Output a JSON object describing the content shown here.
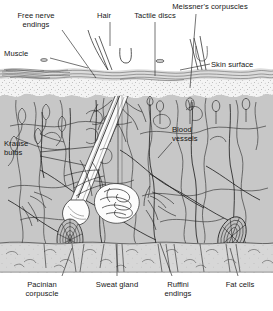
{
  "diagram": {
    "type": "anatomical-cross-section",
    "background_color": "#ffffff",
    "ink_color": "#1a1a1a"
  },
  "layers": [
    {
      "id": "air",
      "name": "Air above skin",
      "color": "#ffffff",
      "y_top": 0,
      "y_bottom": 68
    },
    {
      "id": "stratum",
      "name": "Skin surface / stratum corneum",
      "color": "#d9d9d9",
      "y_top": 68,
      "y_bottom": 82
    },
    {
      "id": "epidermis",
      "name": "Epidermis (stippled)",
      "color": "#f2f2f2",
      "y_top": 82,
      "y_bottom": 100
    },
    {
      "id": "dermis",
      "name": "Dermis",
      "color": "#c6c6c6",
      "y_top": 100,
      "y_bottom": 243
    },
    {
      "id": "subcutis",
      "name": "Subcutaneous fat",
      "color": "#d6d6d6",
      "y_top": 243,
      "y_bottom": 272
    }
  ],
  "labels": [
    {
      "id": "free-nerve-endings",
      "text": "Free nerve\nendings",
      "x": 36,
      "y": 12,
      "align": "center",
      "leader_to": {
        "x": 92,
        "y": 76
      }
    },
    {
      "id": "hair",
      "text": "Hair",
      "x": 103,
      "y": 12,
      "align": "center",
      "leader_to": {
        "x": 110,
        "y": 70
      }
    },
    {
      "id": "tactile-discs",
      "text": "Tactile discs",
      "x": 138,
      "y": 12,
      "align": "center",
      "leader_to": {
        "x": 152,
        "y": 92
      }
    },
    {
      "id": "meissners-corpuscles",
      "text": "Meissner's corpuscles",
      "x": 196,
      "y": 3,
      "align": "center",
      "leader_to": {
        "x": 192,
        "y": 96
      }
    },
    {
      "id": "muscle",
      "text": "Muscle",
      "x": 4,
      "y": 50,
      "align": "left",
      "leader_to": {
        "x": 86,
        "y": 70
      }
    },
    {
      "id": "skin-surface",
      "text": "Skin surface",
      "x": 212,
      "y": 61,
      "align": "left",
      "leader_to": {
        "x": 186,
        "y": 72
      }
    },
    {
      "id": "krause-bulbs",
      "text": "Krause\nbulbs",
      "x": 4,
      "y": 140,
      "align": "left",
      "leader_to": {
        "x": 96,
        "y": 150
      }
    },
    {
      "id": "blood-vessels",
      "text": "Blood\nvessels",
      "x": 172,
      "y": 126,
      "align": "left",
      "leader_to": {
        "x": 166,
        "y": 160
      }
    },
    {
      "id": "pacinian-corpuscle",
      "text": "Pacinian\ncorpuscle",
      "x": 40,
      "y": 281,
      "align": "center",
      "leader_to": {
        "x": 70,
        "y": 250
      }
    },
    {
      "id": "sweat-gland",
      "text": "Sweat gland",
      "x": 116,
      "y": 281,
      "align": "center",
      "leader_to": {
        "x": 117,
        "y": 248
      }
    },
    {
      "id": "ruffini-endings",
      "text": "Ruffini\nendings",
      "x": 178,
      "y": 281,
      "align": "center",
      "leader_to": {
        "x": 165,
        "y": 247
      }
    },
    {
      "id": "fat-cells",
      "text": "Fat cells",
      "x": 240,
      "y": 281,
      "align": "center",
      "leader_to": {
        "x": 228,
        "y": 249
      }
    }
  ],
  "structures": [
    {
      "id": "hair-shaft",
      "name": "Hair shaft",
      "note": "diagonal shaft from upper-right to follicle bulb lower-left"
    },
    {
      "id": "hair-follicle",
      "name": "Hair follicle",
      "note": "white channel with bulb at base"
    },
    {
      "id": "sweat-gland-coil",
      "name": "Sweat gland coil",
      "note": "white coiled tubular mass, center-lower dermis"
    },
    {
      "id": "pacinian-left",
      "name": "Pacinian corpuscle",
      "note": "onion-layered oval, lower left"
    },
    {
      "id": "pacinian-right",
      "name": "Pacinian corpuscle",
      "note": "onion-layered oval, lower right"
    },
    {
      "id": "krause-bulb-group",
      "name": "Krause bulbs",
      "note": "small leaf-like end bulbs, upper left dermis"
    },
    {
      "id": "meissner-group",
      "name": "Meissner's corpuscles",
      "note": "small ovals inside dermal papillae"
    },
    {
      "id": "blood-vessel-net",
      "name": "Blood vessel network",
      "note": "branching squiggly vessels through dermis"
    },
    {
      "id": "nerve-plexus",
      "name": "Nerve plexus",
      "note": "long branching fibers into subcutis"
    },
    {
      "id": "muscle-band",
      "name": "Arrector pili / muscle band",
      "note": "striated band at skin surface left"
    },
    {
      "id": "fat-cell-group",
      "name": "Fat cells",
      "note": "lobules in subcutaneous layer"
    }
  ]
}
